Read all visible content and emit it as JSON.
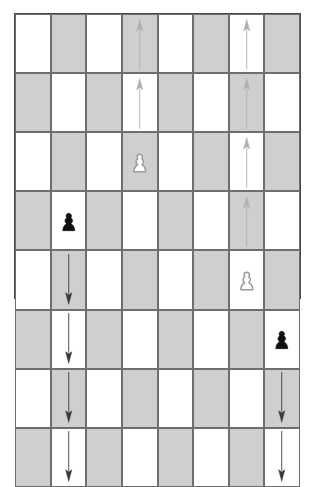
{
  "board": {
    "title": "chess-board-pawn-moves",
    "size": 8,
    "colors": {
      "light_square": "#ffffff",
      "dark_square": "#cfcfcf",
      "border": "#4a4a4a",
      "grid_line": "#6e6e6e",
      "white_piece_fill": "#ffffff",
      "white_piece_stroke": "#9a9a9a",
      "black_piece_fill": "#111111",
      "arrow_light": "#b0b0b0",
      "arrow_dark": "#3a3a3a"
    },
    "files": [
      "a",
      "b",
      "c",
      "d",
      "e",
      "f",
      "g",
      "h"
    ],
    "ranks": [
      "8",
      "7",
      "6",
      "5",
      "4",
      "3",
      "2",
      "1"
    ],
    "squares": [
      [
        {
          "square": "a8",
          "shade": "light",
          "content": "empty"
        },
        {
          "square": "b8",
          "shade": "dark",
          "content": "empty"
        },
        {
          "square": "c8",
          "shade": "light",
          "content": "empty"
        },
        {
          "square": "d8",
          "shade": "dark",
          "content": "arrow-up",
          "arrow_tone": "light"
        },
        {
          "square": "e8",
          "shade": "light",
          "content": "empty"
        },
        {
          "square": "f8",
          "shade": "dark",
          "content": "empty"
        },
        {
          "square": "g8",
          "shade": "light",
          "content": "arrow-up",
          "arrow_tone": "light"
        },
        {
          "square": "h8",
          "shade": "dark",
          "content": "empty"
        }
      ],
      [
        {
          "square": "a7",
          "shade": "dark",
          "content": "empty"
        },
        {
          "square": "b7",
          "shade": "light",
          "content": "empty"
        },
        {
          "square": "c7",
          "shade": "dark",
          "content": "empty"
        },
        {
          "square": "d7",
          "shade": "light",
          "content": "arrow-up",
          "arrow_tone": "light"
        },
        {
          "square": "e7",
          "shade": "dark",
          "content": "empty"
        },
        {
          "square": "f7",
          "shade": "light",
          "content": "empty"
        },
        {
          "square": "g7",
          "shade": "dark",
          "content": "arrow-up",
          "arrow_tone": "light"
        },
        {
          "square": "h7",
          "shade": "light",
          "content": "empty"
        }
      ],
      [
        {
          "square": "a6",
          "shade": "light",
          "content": "empty"
        },
        {
          "square": "b6",
          "shade": "dark",
          "content": "empty"
        },
        {
          "square": "c6",
          "shade": "light",
          "content": "empty"
        },
        {
          "square": "d6",
          "shade": "dark",
          "content": "white-pawn"
        },
        {
          "square": "e6",
          "shade": "light",
          "content": "empty"
        },
        {
          "square": "f6",
          "shade": "dark",
          "content": "empty"
        },
        {
          "square": "g6",
          "shade": "light",
          "content": "arrow-up",
          "arrow_tone": "light"
        },
        {
          "square": "h6",
          "shade": "dark",
          "content": "empty"
        }
      ],
      [
        {
          "square": "a5",
          "shade": "dark",
          "content": "empty"
        },
        {
          "square": "b5",
          "shade": "light",
          "content": "black-pawn"
        },
        {
          "square": "c5",
          "shade": "dark",
          "content": "empty"
        },
        {
          "square": "d5",
          "shade": "light",
          "content": "empty"
        },
        {
          "square": "e5",
          "shade": "dark",
          "content": "empty"
        },
        {
          "square": "f5",
          "shade": "light",
          "content": "empty"
        },
        {
          "square": "g5",
          "shade": "dark",
          "content": "arrow-up",
          "arrow_tone": "light"
        },
        {
          "square": "h5",
          "shade": "light",
          "content": "empty"
        }
      ],
      [
        {
          "square": "a4",
          "shade": "light",
          "content": "empty"
        },
        {
          "square": "b4",
          "shade": "dark",
          "content": "arrow-down",
          "arrow_tone": "dark"
        },
        {
          "square": "c4",
          "shade": "light",
          "content": "empty"
        },
        {
          "square": "d4",
          "shade": "dark",
          "content": "empty"
        },
        {
          "square": "e4",
          "shade": "light",
          "content": "empty"
        },
        {
          "square": "f4",
          "shade": "dark",
          "content": "empty"
        },
        {
          "square": "g4",
          "shade": "light",
          "content": "white-pawn"
        },
        {
          "square": "h4",
          "shade": "dark",
          "content": "empty"
        }
      ],
      [
        {
          "square": "a3",
          "shade": "dark",
          "content": "empty"
        },
        {
          "square": "b3",
          "shade": "light",
          "content": "arrow-down",
          "arrow_tone": "dark"
        },
        {
          "square": "c3",
          "shade": "dark",
          "content": "empty"
        },
        {
          "square": "d3",
          "shade": "light",
          "content": "empty"
        },
        {
          "square": "e3",
          "shade": "dark",
          "content": "empty"
        },
        {
          "square": "f3",
          "shade": "light",
          "content": "empty"
        },
        {
          "square": "g3",
          "shade": "dark",
          "content": "empty"
        },
        {
          "square": "h3",
          "shade": "light",
          "content": "black-pawn"
        }
      ],
      [
        {
          "square": "a2",
          "shade": "light",
          "content": "empty"
        },
        {
          "square": "b2",
          "shade": "dark",
          "content": "arrow-down",
          "arrow_tone": "dark"
        },
        {
          "square": "c2",
          "shade": "light",
          "content": "empty"
        },
        {
          "square": "d2",
          "shade": "dark",
          "content": "empty"
        },
        {
          "square": "e2",
          "shade": "light",
          "content": "empty"
        },
        {
          "square": "f2",
          "shade": "dark",
          "content": "empty"
        },
        {
          "square": "g2",
          "shade": "light",
          "content": "empty"
        },
        {
          "square": "h2",
          "shade": "dark",
          "content": "arrow-down",
          "arrow_tone": "dark"
        }
      ],
      [
        {
          "square": "a1",
          "shade": "dark",
          "content": "empty"
        },
        {
          "square": "b1",
          "shade": "light",
          "content": "arrow-down",
          "arrow_tone": "dark"
        },
        {
          "square": "c1",
          "shade": "dark",
          "content": "empty"
        },
        {
          "square": "d1",
          "shade": "light",
          "content": "empty"
        },
        {
          "square": "e1",
          "shade": "dark",
          "content": "empty"
        },
        {
          "square": "f1",
          "shade": "light",
          "content": "empty"
        },
        {
          "square": "g1",
          "shade": "dark",
          "content": "empty"
        },
        {
          "square": "h1",
          "shade": "light",
          "content": "arrow-down",
          "arrow_tone": "dark"
        }
      ]
    ],
    "pieces": [
      {
        "type": "white-pawn",
        "square": "d6"
      },
      {
        "type": "black-pawn",
        "square": "b5"
      },
      {
        "type": "white-pawn",
        "square": "g4"
      },
      {
        "type": "black-pawn",
        "square": "h3"
      }
    ],
    "move_arrows": [
      {
        "direction": "up",
        "file": "d",
        "squares": [
          "d7",
          "d8"
        ],
        "tone": "light"
      },
      {
        "direction": "up",
        "file": "g",
        "squares": [
          "g5",
          "g6",
          "g7",
          "g8"
        ],
        "tone": "light"
      },
      {
        "direction": "down",
        "file": "b",
        "squares": [
          "b4",
          "b3",
          "b2",
          "b1"
        ],
        "tone": "dark"
      },
      {
        "direction": "down",
        "file": "h",
        "squares": [
          "h2",
          "h1"
        ],
        "tone": "dark"
      }
    ]
  }
}
